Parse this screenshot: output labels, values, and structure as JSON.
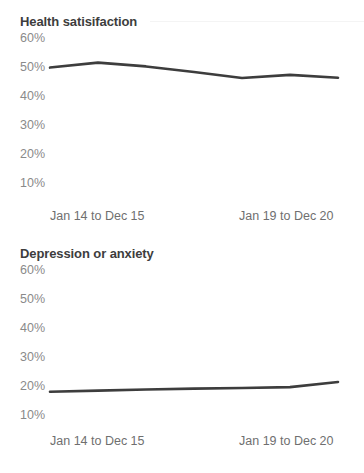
{
  "charts": [
    {
      "title": "Health satisifaction",
      "y_ticks": [
        "60%",
        "50%",
        "40%",
        "30%",
        "20%",
        "10%"
      ],
      "x_ticks": [
        "Jan 14 to Dec 15",
        "Jan 19 to Dec 20"
      ]
    },
    {
      "title": "Depression or anxiety",
      "y_ticks": [
        "60%",
        "50%",
        "40%",
        "30%",
        "20%",
        "10%"
      ],
      "x_ticks": [
        "Jan 14 to Dec 15",
        "Jan 19 to Dec 20"
      ]
    }
  ],
  "chart_data": [
    {
      "type": "line",
      "title": "Health satisifaction",
      "xlabel": "",
      "ylabel": "",
      "ylim": [
        10,
        60
      ],
      "yticks": [
        10,
        20,
        30,
        40,
        50,
        60
      ],
      "ytick_labels": [
        "10%",
        "20%",
        "30%",
        "40%",
        "50%",
        "60%"
      ],
      "x_tick_labels": [
        "Jan 14 to Dec 15",
        "Jan 19 to Dec 20"
      ],
      "x": [
        "Jan 14 to Dec 15",
        "Jan 15 to Dec 16",
        "Jan 16 to Dec 17",
        "Jan 17 to Dec 18",
        "Jan 18 to Dec 19",
        "Jan 19 to Dec 20",
        "Jan 20 to Dec 21"
      ],
      "series": [
        {
          "name": "Health satisifaction",
          "values": [
            49.8,
            51.5,
            50.2,
            48.3,
            46.2,
            47.3,
            46.3
          ],
          "color": "#3d3d3d"
        }
      ],
      "grid": false,
      "legend": "none"
    },
    {
      "type": "line",
      "title": "Depression or anxiety",
      "xlabel": "",
      "ylabel": "",
      "ylim": [
        10,
        60
      ],
      "yticks": [
        10,
        20,
        30,
        40,
        50,
        60
      ],
      "ytick_labels": [
        "10%",
        "20%",
        "30%",
        "40%",
        "50%",
        "60%"
      ],
      "x_tick_labels": [
        "Jan 14 to Dec 15",
        "Jan 19 to Dec 20"
      ],
      "x": [
        "Jan 14 to Dec 15",
        "Jan 15 to Dec 16",
        "Jan 16 to Dec 17",
        "Jan 17 to Dec 18",
        "Jan 18 to Dec 19",
        "Jan 19 to Dec 20",
        "Jan 20 to Dec 21"
      ],
      "series": [
        {
          "name": "Depression or anxiety",
          "values": [
            18.0,
            18.4,
            18.8,
            19.1,
            19.3,
            19.6,
            21.4
          ],
          "color": "#3d3d3d"
        }
      ],
      "grid": false,
      "legend": "none"
    }
  ],
  "colors": {
    "line": "#3d3d3d",
    "title_text": "#3d3d3d",
    "ytick_text": "#8a8a8a",
    "xtick_text": "#6f6f6f",
    "background": "#ffffff",
    "rule": "#f4f4f4"
  }
}
